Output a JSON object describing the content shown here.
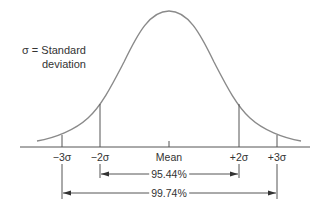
{
  "legend": {
    "line1": "σ = Standard",
    "line2": "deviation"
  },
  "axis": {
    "labels": [
      {
        "key": "minus3",
        "text": "−3σ",
        "x": 62
      },
      {
        "key": "minus2",
        "text": "−2σ",
        "x": 100
      },
      {
        "key": "mean",
        "text": "Mean",
        "x": 169
      },
      {
        "key": "plus2",
        "text": "+2σ",
        "x": 239
      },
      {
        "key": "plus3",
        "text": "+3σ",
        "x": 277
      }
    ]
  },
  "ranges": [
    {
      "label": "95.44%",
      "from": "−2σ",
      "to": "+2σ"
    },
    {
      "label": "99.74%",
      "from": "−3σ",
      "to": "+3σ"
    }
  ],
  "colors": {
    "curve": "#888888",
    "lines": "#555555",
    "text": "#333333"
  }
}
